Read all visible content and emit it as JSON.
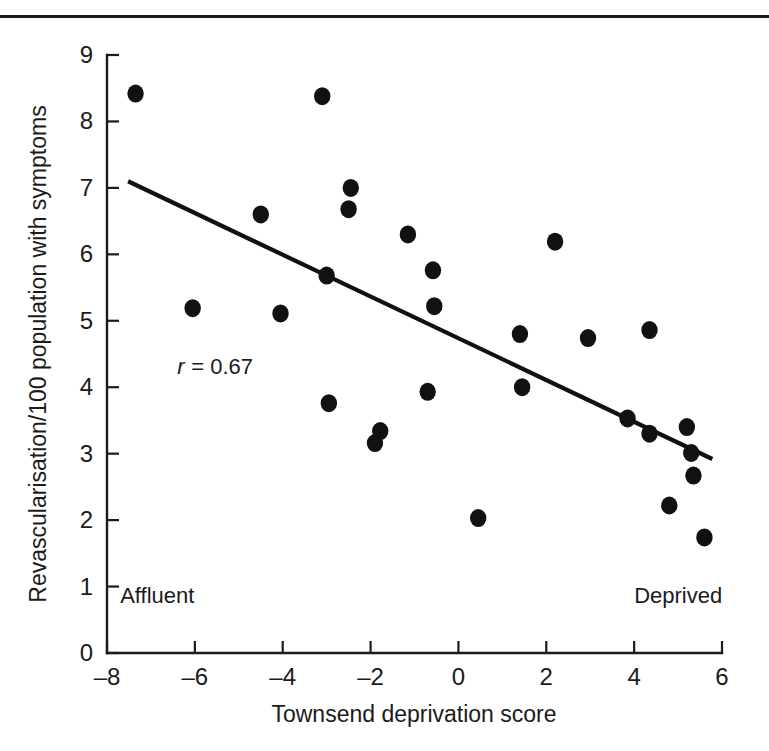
{
  "figure": {
    "kind": "scatter-plot",
    "has_top_rule": true
  },
  "chart_data": {
    "type": "scatter",
    "title": "",
    "xlabel": "Townsend deprivation score",
    "ylabel": "Revascularisation/100 population with symptoms",
    "xlim": [
      -8,
      6
    ],
    "ylim": [
      0,
      9
    ],
    "xticks": [
      -8,
      -6,
      -4,
      -2,
      0,
      2,
      4,
      6
    ],
    "xtick_labels": [
      "–8",
      "–6",
      "–4",
      "–2",
      "0",
      "2",
      "4",
      "6"
    ],
    "yticks": [
      0,
      1,
      2,
      3,
      4,
      5,
      6,
      7,
      8,
      9
    ],
    "ytick_labels": [
      "0",
      "1",
      "2",
      "3",
      "4",
      "5",
      "6",
      "7",
      "8",
      "9"
    ],
    "grid": false,
    "legend": null,
    "annotations": [
      {
        "name": "correlation",
        "text_italic": "r",
        "text": " = 0.67",
        "x": -6.4,
        "y": 4.2
      },
      {
        "name": "x-axis-low-end",
        "text": "Affluent",
        "x": -7.7,
        "y": 0.75
      },
      {
        "name": "x-axis-high-end",
        "text": "Deprived",
        "x": 4.0,
        "y": 0.75
      }
    ],
    "series": [
      {
        "name": "districts",
        "marker": "filled-circle",
        "color": "#111111",
        "points": [
          {
            "x": -7.35,
            "y": 8.42
          },
          {
            "x": -6.05,
            "y": 5.19
          },
          {
            "x": -4.5,
            "y": 6.6
          },
          {
            "x": -4.05,
            "y": 5.11
          },
          {
            "x": -3.1,
            "y": 8.38
          },
          {
            "x": -3.0,
            "y": 5.68
          },
          {
            "x": -2.95,
            "y": 3.76
          },
          {
            "x": -2.45,
            "y": 7.0
          },
          {
            "x": -2.5,
            "y": 6.68
          },
          {
            "x": -1.9,
            "y": 3.16
          },
          {
            "x": -1.78,
            "y": 3.34
          },
          {
            "x": -1.15,
            "y": 6.3
          },
          {
            "x": -0.7,
            "y": 3.93
          },
          {
            "x": -0.58,
            "y": 5.76
          },
          {
            "x": -0.55,
            "y": 5.22
          },
          {
            "x": 0.45,
            "y": 2.03
          },
          {
            "x": 1.4,
            "y": 4.8
          },
          {
            "x": 1.45,
            "y": 4.0
          },
          {
            "x": 2.2,
            "y": 6.19
          },
          {
            "x": 2.95,
            "y": 4.74
          },
          {
            "x": 3.85,
            "y": 3.53
          },
          {
            "x": 4.35,
            "y": 4.86
          },
          {
            "x": 4.35,
            "y": 3.3
          },
          {
            "x": 4.8,
            "y": 2.22
          },
          {
            "x": 5.2,
            "y": 3.4
          },
          {
            "x": 5.3,
            "y": 3.01
          },
          {
            "x": 5.35,
            "y": 2.67
          },
          {
            "x": 5.6,
            "y": 1.74
          }
        ]
      }
    ],
    "fit_line": {
      "name": "regression-line",
      "x0": -7.52,
      "y0": 7.1,
      "x1": 5.78,
      "y1": 2.92,
      "color": "#111111"
    }
  }
}
